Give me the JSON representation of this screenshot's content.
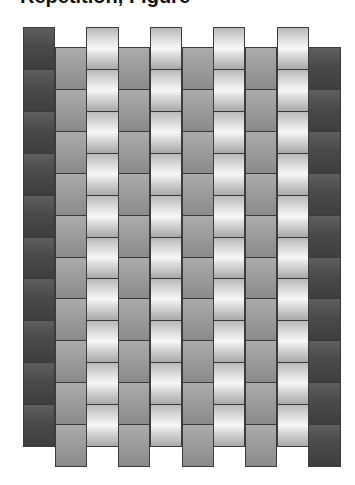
{
  "heading": {
    "text": "Repetition, Figure"
  },
  "weave": {
    "column_count": 10,
    "segments_per_column": 10,
    "origin_x": 23,
    "column_width": 31.7,
    "offsets": {
      "A": {
        "top": 27,
        "bottom": 447
      },
      "B": {
        "top": 47,
        "bottom": 467
      }
    },
    "tones": {
      "dark": "#4a4a4a",
      "medium": "#9b9b9b",
      "light": "#f2f2f2",
      "line": "#3a3a3a"
    },
    "columns": [
      {
        "tone": "dark",
        "offset": "A"
      },
      {
        "tone": "medium",
        "offset": "B"
      },
      {
        "tone": "light",
        "offset": "A"
      },
      {
        "tone": "medium",
        "offset": "B"
      },
      {
        "tone": "light",
        "offset": "A"
      },
      {
        "tone": "medium",
        "offset": "B"
      },
      {
        "tone": "light",
        "offset": "A"
      },
      {
        "tone": "medium",
        "offset": "B"
      },
      {
        "tone": "light",
        "offset": "A"
      },
      {
        "tone": "dark",
        "offset": "B"
      }
    ]
  }
}
